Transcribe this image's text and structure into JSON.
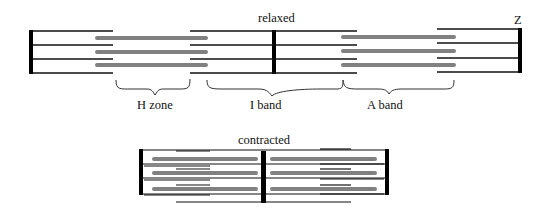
{
  "diagram": {
    "type": "sarcomere",
    "relaxed": {
      "title": "relaxed",
      "z_label": "Z",
      "regions": [
        {
          "label": "H zone"
        },
        {
          "label": "I band"
        },
        {
          "label": "A band"
        }
      ]
    },
    "contracted": {
      "title": "contracted"
    },
    "colors": {
      "thin_filament": "#111111",
      "thick_filament": "#808080",
      "z_disc": "#000000",
      "brace": "#333333"
    }
  }
}
